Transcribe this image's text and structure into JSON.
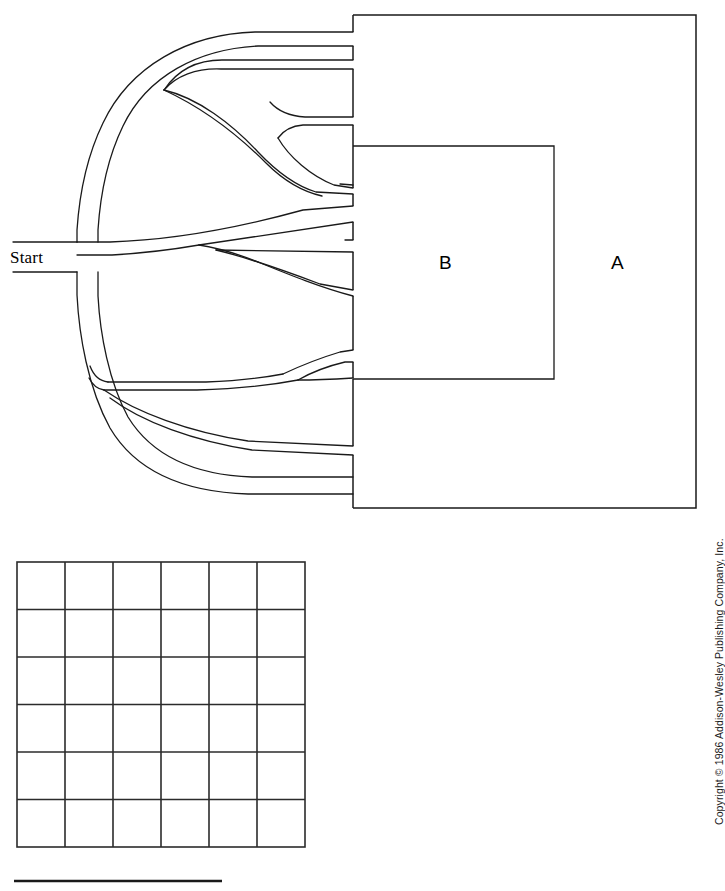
{
  "page": {
    "width": 719,
    "height": 891,
    "background_color": "#ffffff",
    "ink_color": "#1a1a1a"
  },
  "maze": {
    "start_label": "Start",
    "region_a_label": "A",
    "region_b_label": "B",
    "description": "Branching maze with a single Start entrance on the left that splits into multiple curved corridors terminating at the toothed left edge of rectangular region A, which encloses nested rectangular region B."
  },
  "grid": {
    "columns": 6,
    "rows": 6,
    "left": 17,
    "top": 562,
    "width": 288,
    "height": 285,
    "cell_width": 48,
    "cell_height": 47.5,
    "line_color": "#2b2b2b"
  },
  "scale_bar": {
    "left": 14,
    "top": 880,
    "width": 208,
    "thickness": 2.5,
    "color": "#1a1a1a"
  },
  "copyright": {
    "text": "Copyright © 1986 Addison-Wesley Publishing Company, Inc."
  }
}
